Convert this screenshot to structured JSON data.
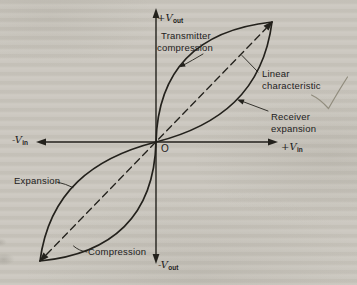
{
  "colors": {
    "paper": "#cbc7bf",
    "ink": "#23211c",
    "pencil": "#8b8677"
  },
  "axis_labels": {
    "y_positive": {
      "main": "+V",
      "sub": "out"
    },
    "y_negative": {
      "main": "-V",
      "sub": "out"
    },
    "x_positive": {
      "main": "+V",
      "sub": "in"
    },
    "x_negative": {
      "main": "-V",
      "sub": "in"
    },
    "origin": "O"
  },
  "annotations": {
    "transmitter_compression": {
      "line1": "Transmitter",
      "line2": "compression"
    },
    "linear_characteristic": {
      "line1": "Linear",
      "line2": "characteristic"
    },
    "receiver_expansion": {
      "line1": "Receiver",
      "line2": "expansion"
    },
    "expansion": "Expansion",
    "compression": "Compression"
  },
  "marks": {
    "checkmark": "pencil-checkmark"
  }
}
